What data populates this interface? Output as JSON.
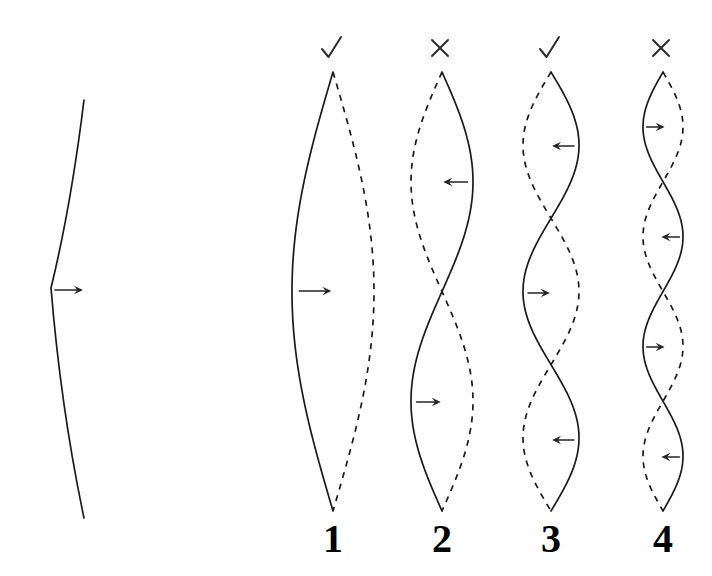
{
  "figure": {
    "background_color": "#ffffff",
    "ink_color": "#1a1a1a",
    "width": 712,
    "height": 576
  },
  "left_panel": {
    "name": "plucked-string",
    "description": "single kinked line with rightward displacement arrow at the kink",
    "kink_point": {
      "x": 51,
      "y": 288
    },
    "top_point": {
      "x": 84,
      "y": 100
    },
    "bottom_point": {
      "x": 84,
      "y": 518
    },
    "arrow": {
      "direction": "right",
      "x": 53,
      "y": 290,
      "length": 28
    }
  },
  "modes": [
    {
      "id": "1",
      "label": "1",
      "verdict": "check",
      "verdict_symbol": "✓",
      "axis_x": 333,
      "amplitude": 41,
      "lobes": 1,
      "top_y": 72,
      "bottom_y": 511,
      "solid_first_bulge": "left",
      "arrows": [
        {
          "direction": "right",
          "y": 291
        }
      ]
    },
    {
      "id": "2",
      "label": "2",
      "verdict": "cross",
      "verdict_symbol": "✕",
      "axis_x": 442,
      "amplitude": 31,
      "lobes": 2,
      "top_y": 72,
      "bottom_y": 511,
      "solid_first_bulge": "right",
      "arrows": [
        {
          "direction": "left",
          "y": 182
        },
        {
          "direction": "right",
          "y": 402
        }
      ]
    },
    {
      "id": "3",
      "label": "3",
      "verdict": "check",
      "verdict_symbol": "✓",
      "axis_x": 551,
      "amplitude": 28,
      "lobes": 3,
      "top_y": 72,
      "bottom_y": 511,
      "solid_first_bulge": "right",
      "arrows": [
        {
          "direction": "left",
          "y": 146
        },
        {
          "direction": "right",
          "y": 293
        },
        {
          "direction": "left",
          "y": 440
        }
      ]
    },
    {
      "id": "4",
      "label": "4",
      "verdict": "cross",
      "verdict_symbol": "✕",
      "axis_x": 663,
      "amplitude": 20,
      "lobes": 4,
      "top_y": 72,
      "bottom_y": 511,
      "solid_first_bulge": "left",
      "arrows": [
        {
          "direction": "right",
          "y": 127
        },
        {
          "direction": "left",
          "y": 237
        },
        {
          "direction": "right",
          "y": 347
        },
        {
          "direction": "left",
          "y": 457
        }
      ]
    }
  ],
  "number_row": {
    "baseline_y": 552,
    "labels": [
      "1",
      "2",
      "3",
      "4"
    ]
  }
}
